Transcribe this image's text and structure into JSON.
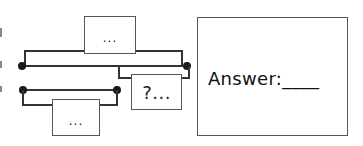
{
  "diagram": {
    "top_box_label": "...",
    "question_box_label": "?...",
    "bottom_box_label": "...",
    "answer_label": "Answer:____"
  },
  "colors": {
    "line": "#333333",
    "dot": "#1a1a1a",
    "box_border": "#555555",
    "background": "#ffffff"
  }
}
